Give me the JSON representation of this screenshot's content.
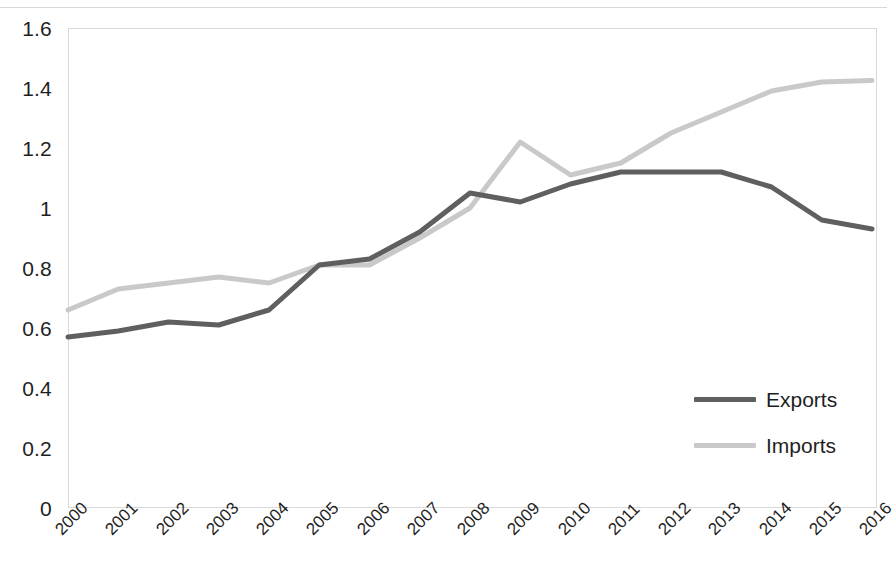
{
  "chart_data": {
    "type": "line",
    "title": "",
    "subtitle": "",
    "xlabel": "",
    "ylabel": "",
    "categories": [
      "2000",
      "2001",
      "2002",
      "2003",
      "2004",
      "2005",
      "2006",
      "2007",
      "2008",
      "2009",
      "2010",
      "2011",
      "2012",
      "2013",
      "2014",
      "2015",
      "2016"
    ],
    "series": [
      {
        "name": "Exports",
        "color": "#5f5f5f",
        "values": [
          0.57,
          0.59,
          0.62,
          0.61,
          0.66,
          0.81,
          0.83,
          0.92,
          1.05,
          1.02,
          1.08,
          1.12,
          1.12,
          1.12,
          1.07,
          0.96,
          0.93
        ]
      },
      {
        "name": "Imports",
        "color": "#c9c9c9",
        "values": [
          0.66,
          0.73,
          0.75,
          0.77,
          0.75,
          0.81,
          0.81,
          0.9,
          1.0,
          1.22,
          1.11,
          1.15,
          1.25,
          1.32,
          1.39,
          1.42,
          1.425
        ]
      }
    ],
    "ylim": [
      0,
      1.6
    ],
    "yticks": [
      "0",
      "0.2",
      "0.4",
      "0.6",
      "0.8",
      "1",
      "1.2",
      "1.4",
      "1.6"
    ],
    "ytick_values": [
      0,
      0.2,
      0.4,
      0.6,
      0.8,
      1,
      1.2,
      1.4,
      1.6
    ],
    "grid": false,
    "legend_position": "inside-bottom-right",
    "xtick_rotation": -45,
    "plot_border_color": "#d9d9d9",
    "background_color": "#ffffff"
  },
  "legend": {
    "items": [
      {
        "label": "Exports",
        "color": "#5f5f5f"
      },
      {
        "label": "Imports",
        "color": "#c9c9c9"
      }
    ]
  }
}
